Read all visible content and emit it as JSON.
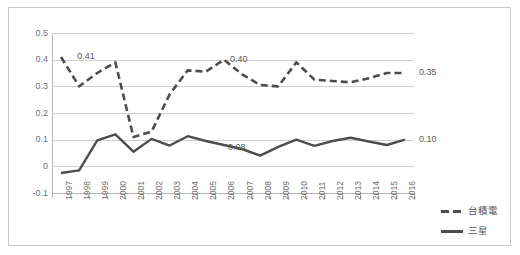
{
  "chart_data": {
    "type": "line",
    "title": "",
    "xlabel": "",
    "ylabel": "",
    "ylim": [
      -0.1,
      0.5
    ],
    "ytick_labels": [
      "0.5",
      "0.4",
      "0.3",
      "0.2",
      "0.1",
      "0",
      "-0.1"
    ],
    "ytick_values": [
      0.5,
      0.4,
      0.3,
      0.2,
      0.1,
      0,
      -0.1
    ],
    "grid": true,
    "legend_position": "right",
    "categories": [
      "1997",
      "1998",
      "1999",
      "2000",
      "2001",
      "2002",
      "2003",
      "2004",
      "2005",
      "2006",
      "2007",
      "2008",
      "2009",
      "2010",
      "2011",
      "2012",
      "2013",
      "2014",
      "2015",
      "2016"
    ],
    "series": [
      {
        "name": "台積電",
        "style": "dashed",
        "color": "#4d4d4d",
        "values": [
          0.41,
          0.3,
          0.35,
          0.39,
          0.11,
          0.13,
          0.27,
          0.36,
          0.355,
          0.4,
          0.345,
          0.305,
          0.3,
          0.39,
          0.325,
          0.32,
          0.315,
          0.33,
          0.35,
          0.35
        ]
      },
      {
        "name": "三星",
        "style": "solid",
        "color": "#4d4d4d",
        "values": [
          -0.025,
          -0.015,
          0.097,
          0.12,
          0.055,
          0.103,
          0.078,
          0.113,
          0.095,
          0.08,
          0.065,
          0.04,
          0.073,
          0.1,
          0.077,
          0.095,
          0.107,
          0.093,
          0.08,
          0.1
        ]
      }
    ],
    "point_labels": [
      {
        "series": "台積電",
        "category": "1998",
        "text": "0.41"
      },
      {
        "series": "台積電",
        "category": "2006",
        "text": "0.40"
      },
      {
        "series": "台積電",
        "category": "2016",
        "text": "0.35"
      },
      {
        "series": "三星",
        "category": "2006",
        "text": "0.08"
      },
      {
        "series": "三星",
        "category": "2016",
        "text": "0.10"
      }
    ]
  },
  "legend": {
    "items": [
      {
        "label": "台積電",
        "style": "dashed"
      },
      {
        "label": "三星",
        "style": "solid"
      }
    ]
  }
}
